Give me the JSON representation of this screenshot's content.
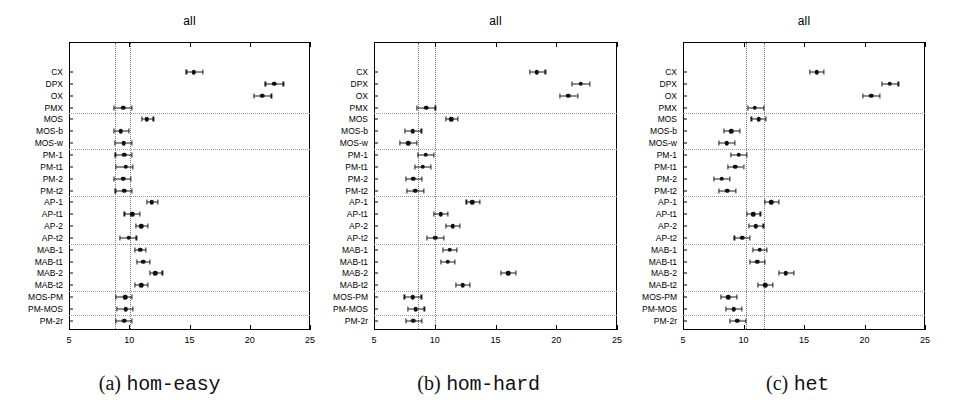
{
  "figure": {
    "panel_title": "all",
    "x_ticks": [
      5,
      10,
      15,
      20,
      25
    ],
    "xlim": [
      5,
      25
    ],
    "row_labels": [
      "CX",
      "DPX",
      "OX",
      "PMX",
      "MOS",
      "MOS-b",
      "MOS-w",
      "PM-1",
      "PM-t1",
      "PM-2",
      "PM-t2",
      "AP-1",
      "AP-t1",
      "AP-2",
      "AP-t2",
      "MAB-1",
      "MAB-t1",
      "MAB-2",
      "MAB-t2",
      "MOS-PM",
      "PM-MOS",
      "PM-2r"
    ],
    "group_breaks_after": [
      "PMX",
      "MOS-w",
      "PM-t2",
      "AP-t2",
      "MAB-t2",
      "PM-MOS"
    ]
  },
  "chart_data": [
    {
      "type": "scatter",
      "panel": "a",
      "title": "all",
      "caption_letter": "(a)",
      "caption_name": "hom-easy",
      "xlabel": "",
      "ylabel": "",
      "xlim": [
        5,
        25
      ],
      "xticks": [
        5,
        10,
        15,
        20,
        25
      ],
      "grid": false,
      "reference_lines": [
        8.8,
        10.1
      ],
      "categories": [
        "CX",
        "DPX",
        "OX",
        "PMX",
        "MOS",
        "MOS-b",
        "MOS-w",
        "PM-1",
        "PM-t1",
        "PM-2",
        "PM-t2",
        "AP-1",
        "AP-t1",
        "AP-2",
        "AP-t2",
        "MAB-1",
        "MAB-t1",
        "MAB-2",
        "MAB-t2",
        "MOS-PM",
        "PM-MOS",
        "PM-2r"
      ],
      "values": [
        15.35,
        22.05,
        21.05,
        9.5,
        11.45,
        9.3,
        9.55,
        9.6,
        9.7,
        9.5,
        9.6,
        11.85,
        10.25,
        11.0,
        9.95,
        10.9,
        11.15,
        12.15,
        11.0,
        9.65,
        9.7,
        9.6
      ],
      "ci_low": [
        14.75,
        21.3,
        20.35,
        8.7,
        11.05,
        8.7,
        8.8,
        8.85,
        8.9,
        8.75,
        8.85,
        11.45,
        9.6,
        10.55,
        9.25,
        10.45,
        10.65,
        11.7,
        10.5,
        8.9,
        8.95,
        8.9
      ],
      "ci_high": [
        16.1,
        22.8,
        21.8,
        10.2,
        12.0,
        9.95,
        10.2,
        10.25,
        10.3,
        10.15,
        10.25,
        12.35,
        10.9,
        11.55,
        10.6,
        11.4,
        11.7,
        12.75,
        11.55,
        10.25,
        10.3,
        10.25
      ]
    },
    {
      "type": "scatter",
      "panel": "b",
      "title": "all",
      "caption_letter": "(b)",
      "caption_name": "hom-hard",
      "xlabel": "",
      "ylabel": "",
      "xlim": [
        5,
        25
      ],
      "xticks": [
        5,
        10,
        15,
        20,
        25
      ],
      "grid": false,
      "reference_lines": [
        8.6,
        10.0
      ],
      "categories": [
        "CX",
        "DPX",
        "OX",
        "PMX",
        "MOS",
        "MOS-b",
        "MOS-w",
        "PM-1",
        "PM-t1",
        "PM-2",
        "PM-t2",
        "AP-1",
        "AP-t1",
        "AP-2",
        "AP-t2",
        "MAB-1",
        "MAB-t1",
        "MAB-2",
        "MAB-t2",
        "MOS-PM",
        "PM-MOS",
        "PM-2r"
      ],
      "values": [
        18.4,
        22.0,
        21.0,
        9.3,
        11.35,
        8.2,
        7.8,
        9.25,
        9.0,
        8.25,
        8.4,
        13.1,
        10.5,
        11.5,
        10.05,
        11.25,
        11.05,
        16.05,
        12.3,
        8.2,
        8.45,
        8.25
      ],
      "ci_low": [
        17.85,
        21.3,
        20.3,
        8.55,
        10.95,
        7.55,
        7.15,
        8.6,
        8.35,
        7.6,
        7.7,
        12.6,
        9.95,
        10.95,
        9.35,
        10.7,
        10.5,
        15.45,
        11.75,
        7.5,
        7.8,
        7.6
      ],
      "ci_high": [
        19.1,
        22.75,
        21.75,
        10.05,
        11.9,
        8.9,
        8.5,
        9.95,
        9.7,
        8.95,
        9.1,
        13.7,
        11.05,
        12.1,
        10.75,
        11.85,
        11.65,
        16.7,
        12.9,
        8.9,
        9.15,
        8.95
      ]
    },
    {
      "type": "scatter",
      "panel": "c",
      "title": "all",
      "caption_letter": "(c)",
      "caption_name": "het",
      "xlabel": "",
      "ylabel": "",
      "xlim": [
        5,
        25
      ],
      "xticks": [
        5,
        10,
        15,
        20,
        25
      ],
      "grid": false,
      "reference_lines": [
        10.2,
        11.7
      ],
      "categories": [
        "CX",
        "DPX",
        "OX",
        "PMX",
        "MOS",
        "MOS-b",
        "MOS-w",
        "PM-1",
        "PM-t1",
        "PM-2",
        "PM-t2",
        "AP-1",
        "AP-t1",
        "AP-2",
        "AP-t2",
        "MAB-1",
        "MAB-t1",
        "MAB-2",
        "MAB-t2",
        "MOS-PM",
        "PM-MOS",
        "PM-2r"
      ],
      "values": [
        16.05,
        22.1,
        20.55,
        10.95,
        11.25,
        9.0,
        8.6,
        9.6,
        9.3,
        8.2,
        8.65,
        12.3,
        10.8,
        11.0,
        9.9,
        11.35,
        11.15,
        13.5,
        11.8,
        8.75,
        9.2,
        9.5
      ],
      "ci_low": [
        15.5,
        21.45,
        19.85,
        10.35,
        10.65,
        8.4,
        7.95,
        8.95,
        8.7,
        7.55,
        8.0,
        11.8,
        10.25,
        10.45,
        9.25,
        10.8,
        10.55,
        12.95,
        11.2,
        8.1,
        8.55,
        8.85
      ],
      "ci_high": [
        16.65,
        22.8,
        21.25,
        11.7,
        11.85,
        9.7,
        9.3,
        10.25,
        10.0,
        8.9,
        9.35,
        12.9,
        11.4,
        11.65,
        10.55,
        11.95,
        11.75,
        14.15,
        12.45,
        9.45,
        9.9,
        10.2
      ]
    }
  ]
}
